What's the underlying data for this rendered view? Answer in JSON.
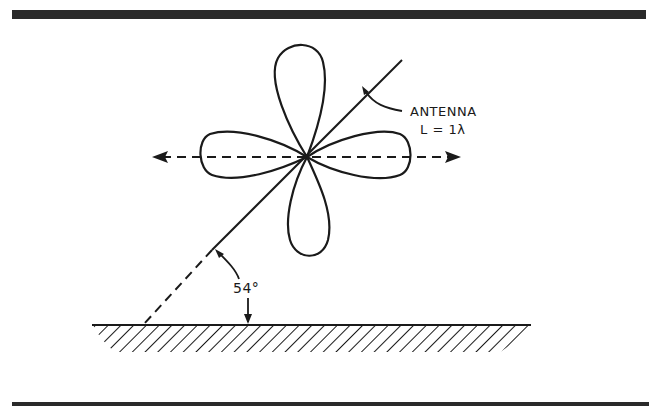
{
  "figure": {
    "antenna_label": "ANTENNA",
    "length_label": "L = 1λ",
    "angle_label": "54°",
    "ink_color": "#1a1a1a",
    "background": "#ffffff",
    "rule_color": "#2a2a2a",
    "elements": {
      "radiation_pattern": "four-lobe (cloverleaf) pattern",
      "antenna_line": "solid diagonal line through pattern center",
      "antenna_extension": "dashed line to ground",
      "horizontal_axis": "dashed double-headed arrow",
      "ground": "hatched ground plane",
      "angle_arc": "arc arrow indicating angle with ground"
    }
  }
}
